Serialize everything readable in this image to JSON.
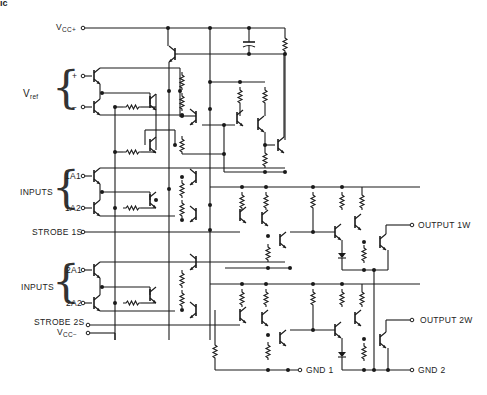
{
  "figure": {
    "corner_text": "ic",
    "supply": {
      "vcc_plus": "V",
      "vcc_plus_sub": "CC+",
      "vcc_minus": "V",
      "vcc_minus_sub": "CC−"
    },
    "vref": {
      "label": "V",
      "label_sub": "ref",
      "plus": "+",
      "minus": "−"
    },
    "channel1": {
      "inputs_label": "INPUTS",
      "input_a": "1A1",
      "input_b": "1A2",
      "strobe": "STROBE 1S",
      "output": "OUTPUT 1W",
      "ground": "GND 1"
    },
    "channel2": {
      "inputs_label": "INPUTS",
      "input_a": "2A1",
      "input_b": "2A2",
      "strobe": "STROBE 2S",
      "output": "OUTPUT 2W",
      "ground": "GND 2"
    }
  }
}
